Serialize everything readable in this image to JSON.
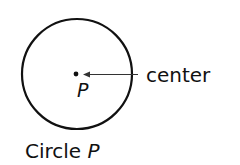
{
  "diagram": {
    "center_label": "P",
    "pointer_label": "center",
    "caption_prefix": "Circle ",
    "caption_var": "P",
    "colors": {
      "stroke": "#111111",
      "arrow": "#333333",
      "background": "#ffffff"
    }
  }
}
